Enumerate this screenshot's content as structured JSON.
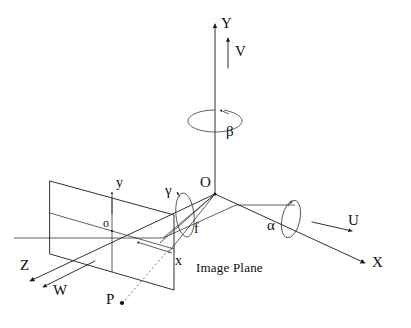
{
  "figure": {
    "caption": "Image Plane",
    "background_color": "#ffffff",
    "line_color": "#1a1a1a"
  },
  "world_axes": [
    {
      "id": "Y",
      "label": "Y",
      "description": "world vertical axis pointing up"
    },
    {
      "id": "X",
      "label": "X",
      "description": "world axis pointing down-right"
    },
    {
      "id": "Z",
      "label": "Z",
      "description": "world axis pointing down-left"
    }
  ],
  "velocity_vectors": [
    {
      "id": "V",
      "label": "V",
      "description": "translation along Y"
    },
    {
      "id": "U",
      "label": "U",
      "description": "translation along X"
    },
    {
      "id": "W",
      "label": "W",
      "description": "translation along Z"
    }
  ],
  "rotation_angles": [
    {
      "id": "beta",
      "label": "β",
      "axis": "Y",
      "description": "rotation about Y axis"
    },
    {
      "id": "alpha",
      "label": "α",
      "axis": "X",
      "description": "rotation about X axis"
    },
    {
      "id": "gamma",
      "label": "γ",
      "axis": "Z",
      "description": "rotation about Z axis"
    }
  ],
  "points": [
    {
      "id": "O",
      "label": "O",
      "description": "camera center / world origin"
    },
    {
      "id": "o",
      "label": "o",
      "description": "principal point on image plane"
    },
    {
      "id": "P",
      "label": "P",
      "description": "scene point"
    }
  ],
  "image_axes": [
    {
      "id": "y",
      "label": "y",
      "description": "image plane vertical axis"
    },
    {
      "id": "x",
      "label": "x",
      "description": "image plane horizontal axis"
    }
  ],
  "measurements": [
    {
      "id": "f",
      "label": "f",
      "description": "focal length from O to image plane"
    }
  ],
  "labels": {
    "Y": "Y",
    "V": "V",
    "beta": "β",
    "O": "O",
    "gamma": "γ",
    "y": "y",
    "o": "o",
    "f": "f",
    "x": "x",
    "alpha": "α",
    "U": "U",
    "X": "X",
    "Z": "Z",
    "W": "W",
    "P": "P",
    "image_plane": "Image Plane"
  }
}
